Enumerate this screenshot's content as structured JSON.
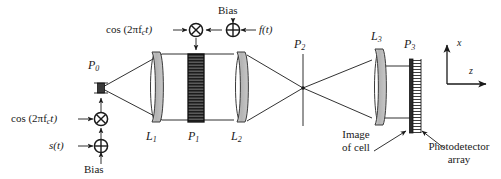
{
  "figure": {
    "type": "optical-system-schematic"
  },
  "colors": {
    "ink": "#1a1a1a",
    "lens_fill": "#b9b9b9",
    "lens_edge": "#3a3a3a",
    "cell_fill": "#4a4a4a",
    "cell_stripe": "#171717",
    "source_fill": "#3a3a3a",
    "background": "#ffffff"
  },
  "planes": [
    {
      "id": "P0",
      "letter": "P",
      "index": "0",
      "x": 100,
      "y_label": 64,
      "role": "point-source-plane"
    },
    {
      "id": "P1",
      "letter": "P",
      "index": "1",
      "x": 196,
      "y_label": 136,
      "role": "acousto-optic-cell-plane"
    },
    {
      "id": "P2",
      "letter": "P",
      "index": "2",
      "x": 303,
      "y_label": 44,
      "role": "fourier-plane"
    },
    {
      "id": "P3",
      "letter": "P",
      "index": "3",
      "x": 411,
      "y_label": 46,
      "role": "detector-plane"
    }
  ],
  "lenses": [
    {
      "id": "L1",
      "letter": "L",
      "index": "1",
      "cx": 155,
      "y_label": 136
    },
    {
      "id": "L2",
      "letter": "L",
      "index": "2",
      "cx": 240,
      "y_label": 136
    },
    {
      "id": "L3",
      "letter": "L",
      "index": "3",
      "cx": 379,
      "y_label": 36
    }
  ],
  "input_chain_left": {
    "carrier_label": "cos (2πf",
    "carrier_sub": "c",
    "carrier_tail": "t)",
    "multiplier_symbol": "⊗",
    "adder_symbol": "⊕",
    "signal_label": "s(t)",
    "bias_label": "Bias"
  },
  "input_chain_top": {
    "carrier_label": "cos (2πf",
    "carrier_sub": "c",
    "carrier_tail": "t)",
    "multiplier_symbol": "⊗",
    "adder_symbol": "⊕",
    "signal_label": "f(t)",
    "bias_label": "Bias"
  },
  "annotations": [
    {
      "id": "image-of-cell",
      "line1": "Image",
      "line2": "of cell"
    },
    {
      "id": "photodetector-array",
      "line1": "Photodetector",
      "line2": "array"
    }
  ],
  "axes": {
    "vertical_label": "x",
    "horizontal_label": "z"
  }
}
